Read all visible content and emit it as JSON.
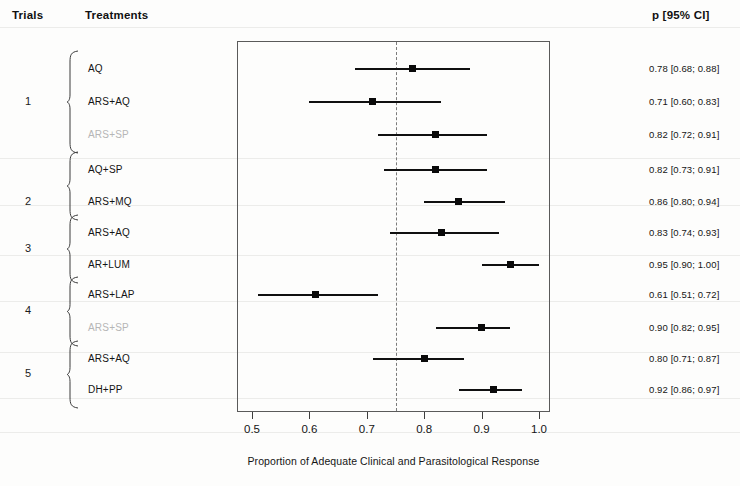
{
  "headers": {
    "trials": "Trials",
    "treatments": "Treatments",
    "ci": "p [95% CI]"
  },
  "axis": {
    "title": "Proportion of Adequate Clinical and Parasitological Response",
    "ticks": [
      "0.5",
      "0.6",
      "0.7",
      "0.8",
      "0.9",
      "1.0"
    ],
    "min": 0.5,
    "max": 1.0,
    "reference_line": 0.75
  },
  "trials": [
    {
      "number": "1",
      "rows": [
        0,
        1,
        2
      ]
    },
    {
      "number": "2",
      "rows": [
        3,
        4
      ]
    },
    {
      "number": "3",
      "rows": [
        5,
        6
      ]
    },
    {
      "number": "4",
      "rows": [
        7,
        8
      ]
    },
    {
      "number": "5",
      "rows": [
        9,
        10
      ]
    }
  ],
  "rows": [
    {
      "treatment": "AQ",
      "faded": false,
      "p": 0.78,
      "low": 0.68,
      "high": 0.88,
      "ci_text": "0.78 [0.68; 0.88]"
    },
    {
      "treatment": "ARS+AQ",
      "faded": false,
      "p": 0.71,
      "low": 0.6,
      "high": 0.83,
      "ci_text": "0.71 [0.60; 0.83]"
    },
    {
      "treatment": "ARS+SP",
      "faded": true,
      "p": 0.82,
      "low": 0.72,
      "high": 0.91,
      "ci_text": "0.82 [0.72; 0.91]"
    },
    {
      "treatment": "AQ+SP",
      "faded": false,
      "p": 0.82,
      "low": 0.73,
      "high": 0.91,
      "ci_text": "0.82 [0.73; 0.91]"
    },
    {
      "treatment": "ARS+MQ",
      "faded": false,
      "p": 0.86,
      "low": 0.8,
      "high": 0.94,
      "ci_text": "0.86 [0.80; 0.94]"
    },
    {
      "treatment": "ARS+AQ",
      "faded": false,
      "p": 0.83,
      "low": 0.74,
      "high": 0.93,
      "ci_text": "0.83 [0.74; 0.93]"
    },
    {
      "treatment": "AR+LUM",
      "faded": false,
      "p": 0.95,
      "low": 0.9,
      "high": 1.0,
      "ci_text": "0.95 [0.90; 1.00]"
    },
    {
      "treatment": "ARS+LAP",
      "faded": false,
      "p": 0.61,
      "low": 0.51,
      "high": 0.72,
      "ci_text": "0.61 [0.51; 0.72]"
    },
    {
      "treatment": "ARS+SP",
      "faded": true,
      "p": 0.9,
      "low": 0.82,
      "high": 0.95,
      "ci_text": "0.90 [0.82; 0.95]"
    },
    {
      "treatment": "ARS+AQ",
      "faded": false,
      "p": 0.8,
      "low": 0.71,
      "high": 0.87,
      "ci_text": "0.80 [0.71; 0.87]"
    },
    {
      "treatment": "DH+PP",
      "faded": false,
      "p": 0.92,
      "low": 0.86,
      "high": 0.97,
      "ci_text": "0.92 [0.86; 0.97]"
    }
  ],
  "chart_data": {
    "type": "scatter",
    "title": "",
    "xlabel": "Proportion of Adequate Clinical and Parasitological Response",
    "ylabel": "",
    "xlim": [
      0.5,
      1.0
    ],
    "xticks": [
      0.5,
      0.6,
      0.7,
      0.8,
      0.9,
      1.0
    ],
    "grid": false,
    "legend": "none",
    "reference_line_x": 0.75,
    "categories": [
      "AQ",
      "ARS+AQ",
      "ARS+SP",
      "AQ+SP",
      "ARS+MQ",
      "ARS+AQ",
      "AR+LUM",
      "ARS+LAP",
      "ARS+SP",
      "ARS+AQ",
      "DH+PP"
    ],
    "trial_groups": [
      "1",
      "1",
      "1",
      "2",
      "2",
      "3",
      "3",
      "4",
      "4",
      "5",
      "5"
    ],
    "values": [
      0.78,
      0.71,
      0.82,
      0.82,
      0.86,
      0.83,
      0.95,
      0.61,
      0.9,
      0.8,
      0.92
    ],
    "ci_low": [
      0.68,
      0.6,
      0.72,
      0.73,
      0.8,
      0.74,
      0.9,
      0.51,
      0.82,
      0.71,
      0.86
    ],
    "ci_high": [
      0.88,
      0.83,
      0.91,
      0.91,
      0.94,
      0.93,
      1.0,
      0.72,
      0.95,
      0.87,
      0.97
    ],
    "annotations": [
      "0.78 [0.68; 0.88]",
      "0.71 [0.60; 0.83]",
      "0.82 [0.72; 0.91]",
      "0.82 [0.73; 0.91]",
      "0.86 [0.80; 0.94]",
      "0.83 [0.74; 0.93]",
      "0.95 [0.90; 1.00]",
      "0.61 [0.51; 0.72]",
      "0.90 [0.82; 0.95]",
      "0.80 [0.71; 0.87]",
      "0.92 [0.86; 0.97]"
    ]
  },
  "layout": {
    "row_y": [
      69,
      102,
      135,
      170,
      202,
      233,
      265,
      295,
      328,
      359,
      390
    ],
    "trial_y": [
      102,
      202,
      249,
      311,
      374
    ],
    "plot_left": 237,
    "plot_top": 41,
    "plot_width": 313,
    "plot_height": 371,
    "streaks": [
      27,
      158,
      205,
      255,
      301,
      352,
      398,
      432
    ]
  }
}
